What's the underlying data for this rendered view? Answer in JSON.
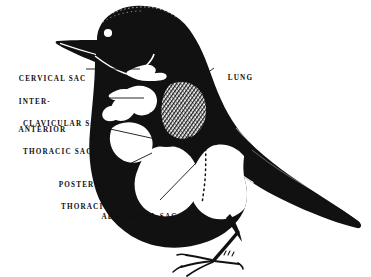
{
  "figure": {
    "width": 371,
    "height": 277,
    "background_color": "#ffffff",
    "ink_color": "#111111",
    "cavity_color": "#ffffff"
  },
  "labels": {
    "cervical": {
      "line1": "CERVICAL SAC"
    },
    "interclavicular": {
      "line1": "INTER-",
      "line2": "CLAVICULAR SAC"
    },
    "anterior_thoracic": {
      "line1": "ANTERIOR",
      "line2": "THORACIC SAC"
    },
    "posterior_thoracic": {
      "line1": "POSTERIOR",
      "line2": "THORACIC SAC"
    },
    "abdominal": {
      "line1": "ABDOMINAL SAC"
    },
    "lung": {
      "line1": "LUNG"
    }
  },
  "parts": [
    {
      "name": "cervical-sac",
      "label": "CERVICAL SAC"
    },
    {
      "name": "interclavicular-sac",
      "label": "INTER-CLAVICULAR SAC"
    },
    {
      "name": "anterior-thoracic-sac",
      "label": "ANTERIOR THORACIC SAC"
    },
    {
      "name": "posterior-thoracic-sac",
      "label": "POSTERIOR THORACIC SAC"
    },
    {
      "name": "abdominal-sac",
      "label": "ABDOMINAL SAC"
    },
    {
      "name": "lung",
      "label": "LUNG"
    }
  ]
}
